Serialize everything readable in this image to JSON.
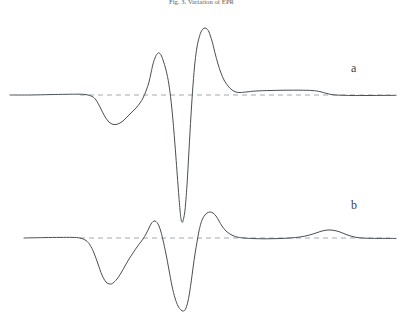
{
  "figure": {
    "caption_top": "Fig. 3. Variation of EPR",
    "background_color": "#ffffff",
    "width": 403,
    "height": 329
  },
  "labels": {
    "trace_a": "a",
    "trace_b": "b"
  },
  "style": {
    "trace_color": "#4a4f53",
    "baseline_color": "#9aa0a6",
    "trace_width": 1.0,
    "baseline_dash": "5 4"
  },
  "chart_data": {
    "type": "line",
    "title": "Fig. 3. Variation of EPR",
    "xlabel": "",
    "ylabel": "",
    "grid": false,
    "legend": "right-inline",
    "axis_visible": false,
    "xlim": [
      0,
      403
    ],
    "series": [
      {
        "name": "a",
        "label": "a",
        "baseline_y": 95,
        "baseline_x_start": 80,
        "baseline_x_end": 390,
        "color": "#4a4f53",
        "points": [
          [
            10,
            95
          ],
          [
            30,
            95
          ],
          [
            50,
            94.6
          ],
          [
            66,
            94.3
          ],
          [
            78,
            94.2
          ],
          [
            86,
            94.6
          ],
          [
            92,
            96.4
          ],
          [
            96,
            100
          ],
          [
            100,
            107
          ],
          [
            104,
            115
          ],
          [
            108,
            121
          ],
          [
            112,
            124
          ],
          [
            116,
            124.5
          ],
          [
            120,
            123
          ],
          [
            124,
            120
          ],
          [
            128,
            116
          ],
          [
            132,
            112
          ],
          [
            136,
            108
          ],
          [
            140,
            103
          ],
          [
            143,
            98
          ],
          [
            146,
            91
          ],
          [
            149,
            82
          ],
          [
            151,
            73
          ],
          [
            153,
            64
          ],
          [
            155,
            58
          ],
          [
            157,
            54
          ],
          [
            159,
            53
          ],
          [
            161,
            55
          ],
          [
            163,
            60
          ],
          [
            166,
            70
          ],
          [
            169,
            85
          ],
          [
            172,
            110
          ],
          [
            175,
            145
          ],
          [
            178,
            185
          ],
          [
            180,
            210
          ],
          [
            181,
            219
          ],
          [
            182,
            222
          ],
          [
            183,
            221
          ],
          [
            185,
            210
          ],
          [
            187,
            185
          ],
          [
            189,
            150
          ],
          [
            191,
            115
          ],
          [
            193,
            85
          ],
          [
            195,
            62
          ],
          [
            197,
            47
          ],
          [
            199,
            38
          ],
          [
            201,
            32
          ],
          [
            203,
            29
          ],
          [
            205,
            28
          ],
          [
            207,
            29
          ],
          [
            209,
            32
          ],
          [
            212,
            41
          ],
          [
            215,
            53
          ],
          [
            218,
            64
          ],
          [
            221,
            73
          ],
          [
            224,
            80
          ],
          [
            228,
            86
          ],
          [
            232,
            90
          ],
          [
            236,
            92
          ],
          [
            240,
            92.5
          ],
          [
            246,
            92
          ],
          [
            256,
            91
          ],
          [
            270,
            90.5
          ],
          [
            286,
            90.2
          ],
          [
            300,
            90.2
          ],
          [
            312,
            90.5
          ],
          [
            320,
            91.6
          ],
          [
            326,
            93.3
          ],
          [
            332,
            94.6
          ],
          [
            340,
            95.2
          ],
          [
            352,
            95.5
          ],
          [
            368,
            95.5
          ],
          [
            384,
            95.4
          ],
          [
            396,
            95.3
          ]
        ]
      },
      {
        "name": "b",
        "label": "b",
        "baseline_y": 238,
        "baseline_x_start": 80,
        "baseline_x_end": 390,
        "color": "#4a4f53",
        "points": [
          [
            24,
            238
          ],
          [
            44,
            237.6
          ],
          [
            60,
            237.4
          ],
          [
            72,
            237.4
          ],
          [
            80,
            238
          ],
          [
            86,
            240.5
          ],
          [
            90,
            245
          ],
          [
            94,
            253
          ],
          [
            98,
            264
          ],
          [
            102,
            275
          ],
          [
            106,
            282
          ],
          [
            110,
            284
          ],
          [
            113,
            283
          ],
          [
            117,
            279
          ],
          [
            121,
            273
          ],
          [
            125,
            266
          ],
          [
            129,
            259
          ],
          [
            133,
            253
          ],
          [
            137,
            247
          ],
          [
            140,
            243
          ],
          [
            143,
            239
          ],
          [
            146,
            234
          ],
          [
            149,
            228
          ],
          [
            151,
            224
          ],
          [
            153,
            221.5
          ],
          [
            155,
            221
          ],
          [
            157,
            222.5
          ],
          [
            159,
            226
          ],
          [
            161,
            232
          ],
          [
            163,
            240
          ],
          [
            166,
            254
          ],
          [
            169,
            270
          ],
          [
            172,
            286
          ],
          [
            175,
            298
          ],
          [
            178,
            306
          ],
          [
            181,
            310
          ],
          [
            183,
            311
          ],
          [
            185,
            310
          ],
          [
            187,
            305
          ],
          [
            189,
            296
          ],
          [
            191,
            283
          ],
          [
            193,
            268
          ],
          [
            195,
            254
          ],
          [
            197,
            242
          ],
          [
            199,
            231
          ],
          [
            201,
            223
          ],
          [
            203,
            218
          ],
          [
            205,
            215
          ],
          [
            207,
            213
          ],
          [
            210,
            212
          ],
          [
            213,
            213
          ],
          [
            216,
            216
          ],
          [
            219,
            221
          ],
          [
            222,
            226
          ],
          [
            226,
            231
          ],
          [
            230,
            234
          ],
          [
            234,
            236
          ],
          [
            238,
            237.2
          ],
          [
            244,
            238
          ],
          [
            254,
            238.6
          ],
          [
            266,
            238.8
          ],
          [
            278,
            238.6
          ],
          [
            290,
            238
          ],
          [
            300,
            237
          ],
          [
            308,
            235.4
          ],
          [
            316,
            233
          ],
          [
            322,
            231
          ],
          [
            328,
            230
          ],
          [
            334,
            230.4
          ],
          [
            340,
            232
          ],
          [
            346,
            234.4
          ],
          [
            352,
            236.4
          ],
          [
            358,
            237.6
          ],
          [
            366,
            238.2
          ],
          [
            378,
            238.4
          ],
          [
            396,
            238.4
          ]
        ]
      }
    ],
    "annotations": [
      {
        "text": "a",
        "x": 355,
        "y": 68
      },
      {
        "text": "b",
        "x": 355,
        "y": 205
      }
    ]
  }
}
